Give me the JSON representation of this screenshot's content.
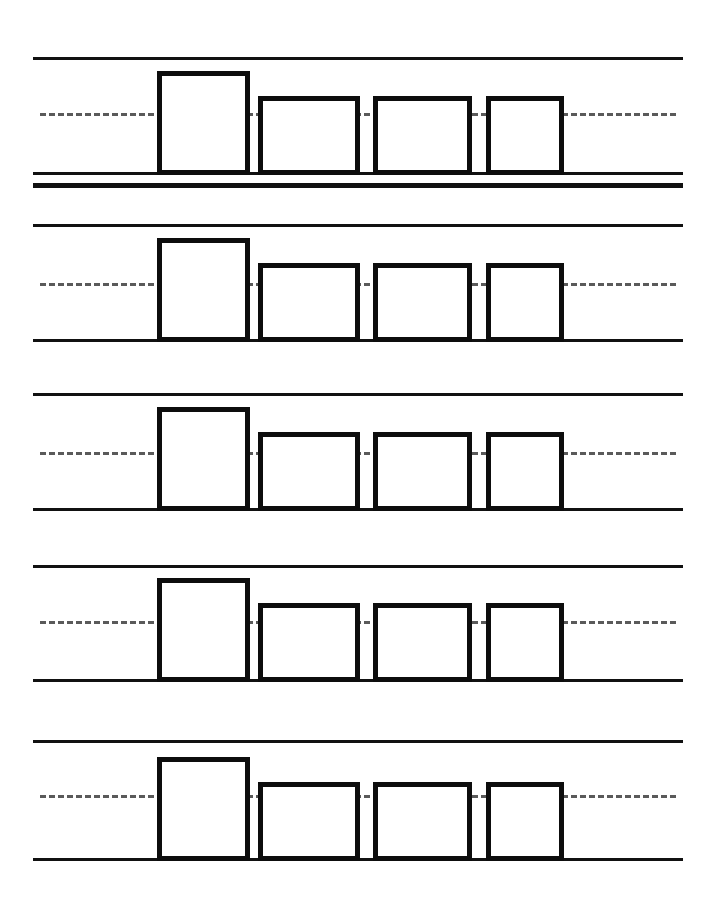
{
  "worksheet": {
    "title": "Square Tracing Practice Worksheet",
    "page_width": 720,
    "page_height": 906,
    "background_color": "#ffffff",
    "ink_color": "#111111",
    "shape_outline_color": "#0d0d0d",
    "dashed_guide_color": "#5a5a5a",
    "row_count": 5,
    "shapes_per_row": 4,
    "shape_name": "square"
  },
  "geometry": {
    "line_left_x": 33,
    "line_right_x": 683,
    "dashed_left_x": 40,
    "dashed_right_x": 676,
    "solid_line_thickness": 3,
    "extra_line_thickness": 5,
    "dashed_line_thickness": 3,
    "shape_stroke_width": 5
  },
  "shape_columns": [
    {
      "name": "square-1",
      "x": 157,
      "width": 93,
      "height": 104
    },
    {
      "name": "square-2",
      "x": 258,
      "width": 102,
      "height": 79
    },
    {
      "name": "square-3",
      "x": 373,
      "width": 99,
      "height": 79
    },
    {
      "name": "square-4",
      "x": 486,
      "width": 78,
      "height": 79
    }
  ],
  "rows": [
    {
      "name": "practice-row-1",
      "index": 1,
      "top_line_y": 57,
      "dashed_line_y": 113,
      "baseline_y": 172,
      "has_extra_line": true,
      "extra_line_y": 183
    },
    {
      "name": "practice-row-2",
      "index": 2,
      "top_line_y": 224,
      "dashed_line_y": 283,
      "baseline_y": 339,
      "has_extra_line": false,
      "extra_line_y": null
    },
    {
      "name": "practice-row-3",
      "index": 3,
      "top_line_y": 393,
      "dashed_line_y": 452,
      "baseline_y": 508,
      "has_extra_line": false,
      "extra_line_y": null
    },
    {
      "name": "practice-row-4",
      "index": 4,
      "top_line_y": 565,
      "dashed_line_y": 621,
      "baseline_y": 679,
      "has_extra_line": false,
      "extra_line_y": null
    },
    {
      "name": "practice-row-5",
      "index": 5,
      "top_line_y": 740,
      "dashed_line_y": 795,
      "baseline_y": 858,
      "has_extra_line": false,
      "extra_line_y": null
    }
  ]
}
